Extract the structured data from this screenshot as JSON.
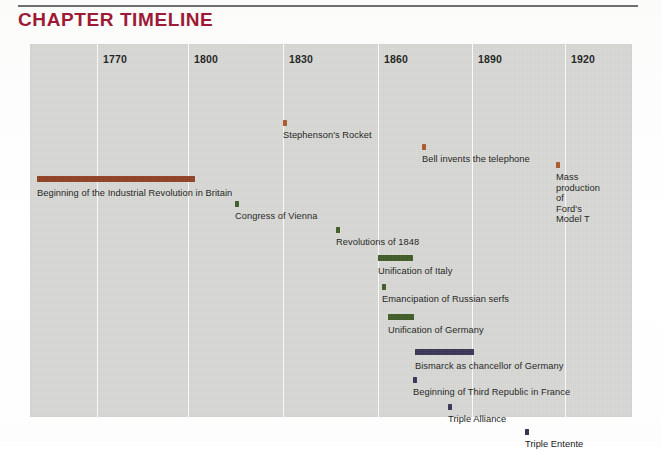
{
  "header": {
    "title": "CHAPTER TIMELINE",
    "title_color": "#9d1a37",
    "rule_color": "#6f6f72"
  },
  "panel": {
    "background_color": "#d7d8d4",
    "gridline_color": "#fbfbfb"
  },
  "chart_data": {
    "type": "bar",
    "orientation": "horizontal-timeline",
    "title": "CHAPTER TIMELINE",
    "xlabel": "",
    "ylabel": "",
    "xlim": [
      1755,
      1940
    ],
    "grid": true,
    "legend": false,
    "axis_ticks": [
      "1770",
      "1800",
      "1830",
      "1860",
      "1890",
      "1920"
    ],
    "tick_values": [
      1770,
      1800,
      1830,
      1860,
      1890,
      1920
    ],
    "colors": {
      "industry": "#8f4023",
      "invention": "#a85a2a",
      "politics": "#3e5b26",
      "germany": "#3b3354"
    },
    "events": [
      {
        "label": "Stephenson's Rocket",
        "start": 1829,
        "end": 1830,
        "kind": "point",
        "color": "#a85a2a"
      },
      {
        "label": "Bell invents the telephone",
        "start": 1876,
        "end": 1877,
        "kind": "point",
        "color": "#a85a2a"
      },
      {
        "label": "Mass production of\nFord's Model T",
        "start": 1913,
        "end": 1914,
        "kind": "point",
        "color": "#a85a2a"
      },
      {
        "label": "Beginning of the Industrial Revolution in Britain",
        "start": 1760,
        "end": 1810,
        "kind": "span",
        "color": "#8f4023"
      },
      {
        "label": "Congress of Vienna",
        "start": 1815,
        "end": 1816,
        "kind": "point",
        "color": "#3e5b26"
      },
      {
        "label": "Revolutions of 1848",
        "start": 1848,
        "end": 1849,
        "kind": "point",
        "color": "#3e5b26"
      },
      {
        "label": "Unification of Italy",
        "start": 1860,
        "end": 1871,
        "kind": "span",
        "color": "#3e5b26"
      },
      {
        "label": "Emancipation of Russian serfs",
        "start": 1861,
        "end": 1862,
        "kind": "point",
        "color": "#3e5b26"
      },
      {
        "label": "Unification of Germany",
        "start": 1864,
        "end": 1872,
        "kind": "span",
        "color": "#3e5b26"
      },
      {
        "label": "Bismarck as chancellor of Germany",
        "start": 1871,
        "end": 1890,
        "kind": "span",
        "color": "#3b3354"
      },
      {
        "label": "Beginning of Third Republic in France",
        "start": 1870,
        "end": 1871,
        "kind": "point",
        "color": "#3b3354"
      },
      {
        "label": "Triple Alliance",
        "start": 1882,
        "end": 1883,
        "kind": "point",
        "color": "#3b3354"
      },
      {
        "label": "Triple Entente",
        "start": 1907,
        "end": 1908,
        "kind": "point",
        "color": "#3b3354"
      }
    ]
  },
  "layout": {
    "gridlines_px": [
      97,
      188,
      283,
      378,
      472,
      565
    ],
    "events_px": [
      {
        "x": 283,
        "w": 4,
        "y": 76,
        "label_x": 283,
        "label_y": 86,
        "lines": 1
      },
      {
        "x": 422,
        "w": 4,
        "y": 100,
        "label_x": 422,
        "label_y": 110,
        "lines": 1
      },
      {
        "x": 556,
        "w": 4,
        "y": 118,
        "label_x": 556,
        "label_y": 128,
        "lines": 2
      },
      {
        "x": 37,
        "w": 158,
        "y": 132,
        "label_x": 37,
        "label_y": 144,
        "lines": 1
      },
      {
        "x": 235,
        "w": 4,
        "y": 157,
        "label_x": 235,
        "label_y": 167,
        "lines": 1
      },
      {
        "x": 336,
        "w": 4,
        "y": 183,
        "label_x": 336,
        "label_y": 193,
        "lines": 1
      },
      {
        "x": 378,
        "w": 35,
        "y": 211,
        "label_x": 378,
        "label_y": 222,
        "lines": 1
      },
      {
        "x": 382,
        "w": 4,
        "y": 240,
        "label_x": 382,
        "label_y": 250,
        "lines": 1
      },
      {
        "x": 388,
        "w": 26,
        "y": 270,
        "label_x": 388,
        "label_y": 281,
        "lines": 1
      },
      {
        "x": 415,
        "w": 59,
        "y": 305,
        "label_x": 415,
        "label_y": 317,
        "lines": 1
      },
      {
        "x": 413,
        "w": 4,
        "y": 333,
        "label_x": 413,
        "label_y": 343,
        "lines": 1
      },
      {
        "x": 448,
        "w": 4,
        "y": 360,
        "label_x": 448,
        "label_y": 370,
        "lines": 1
      },
      {
        "x": 525,
        "w": 4,
        "y": 385,
        "label_x": 525,
        "label_y": 395,
        "lines": 1
      }
    ]
  }
}
